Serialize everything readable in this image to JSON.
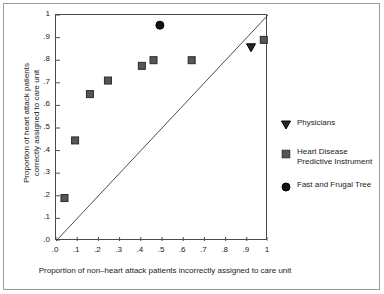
{
  "chart_data": {
    "type": "scatter",
    "title": "",
    "xlabel": "Proportion of non–heart attack patients incorrectly assigned to care unit",
    "ylabel_lines": [
      "Proportion of heart attack patients",
      "correctly assigned to care unit"
    ],
    "xlim": [
      0,
      1
    ],
    "ylim": [
      0,
      1
    ],
    "grid": false,
    "legend_position": "right",
    "xticks": [
      0,
      0.1,
      0.2,
      0.3,
      0.4,
      0.5,
      0.6,
      0.7,
      0.8,
      0.9,
      1
    ],
    "xticklabels": [
      ".0",
      ".1",
      ".2",
      ".3",
      ".4",
      ".5",
      ".6",
      ".7",
      ".8",
      ".9",
      "1"
    ],
    "yticks": [
      0,
      0.1,
      0.2,
      0.3,
      0.4,
      0.5,
      0.6,
      0.7,
      0.8,
      0.9,
      1
    ],
    "yticklabels": [
      ".0",
      ".1",
      ".2",
      ".3",
      ".4",
      ".5",
      ".6",
      ".7",
      ".8",
      ".9",
      "1"
    ],
    "reference_line": {
      "name": "diagonal-chance-line",
      "x": [
        0,
        1
      ],
      "y": [
        0,
        1
      ],
      "color": "#3a3a3a"
    },
    "series": [
      {
        "name": "Heart Disease Predictive Instrument",
        "marker": "square",
        "color": "#565656",
        "edge_color": "#2b2b2b",
        "size": 7,
        "points": [
          {
            "x": 0.04,
            "y": 0.19
          },
          {
            "x": 0.09,
            "y": 0.445
          },
          {
            "x": 0.16,
            "y": 0.65
          },
          {
            "x": 0.245,
            "y": 0.71
          },
          {
            "x": 0.405,
            "y": 0.775
          },
          {
            "x": 0.46,
            "y": 0.8
          },
          {
            "x": 0.64,
            "y": 0.8
          },
          {
            "x": 0.98,
            "y": 0.89
          }
        ]
      },
      {
        "name": "Fast and Frugal Tree",
        "marker": "circle",
        "color": "#111111",
        "edge_color": "#000000",
        "size": 8,
        "points": [
          {
            "x": 0.49,
            "y": 0.955
          }
        ]
      },
      {
        "name": "Physicians",
        "marker": "triangle-down",
        "color": "#262626",
        "edge_color": "#000000",
        "size": 9,
        "points": [
          {
            "x": 0.92,
            "y": 0.855
          }
        ]
      }
    ]
  },
  "legend": {
    "entries": [
      {
        "marker": "triangle-down",
        "label_lines": [
          "Physicians"
        ]
      },
      {
        "marker": "square",
        "label_lines": [
          "Heart Disease",
          "Predictive Instrument"
        ]
      },
      {
        "marker": "circle",
        "label_lines": [
          "Fast and Frugal Tree"
        ]
      }
    ]
  },
  "colors": {
    "frame": "#4a4a4a",
    "outer_border": "#9a9a9a",
    "text": "#1a1a1a",
    "background": "#ffffff"
  }
}
